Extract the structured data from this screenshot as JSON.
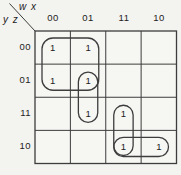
{
  "diagram": {
    "type": "karnaugh_map",
    "corner": {
      "top_label": "w x",
      "side_label": "y z"
    },
    "col_headers": [
      "00",
      "01",
      "11",
      "10"
    ],
    "row_headers": [
      "00",
      "01",
      "11",
      "10"
    ],
    "cells": [
      "1",
      "1",
      "",
      "",
      "1",
      "1",
      "",
      "",
      "",
      "1",
      "1",
      "",
      "",
      "",
      "1",
      "1"
    ],
    "loops": [
      {
        "id": "loop-1",
        "rows": [
          0,
          1
        ],
        "cols": [
          0,
          1
        ]
      },
      {
        "id": "loop-2",
        "rows": [
          1,
          2
        ],
        "cols": [
          1,
          1
        ]
      },
      {
        "id": "loop-3",
        "rows": [
          2,
          3
        ],
        "cols": [
          2,
          2
        ]
      },
      {
        "id": "loop-4",
        "rows": [
          3,
          3
        ],
        "cols": [
          2,
          3
        ]
      }
    ],
    "colors": {
      "background": "#f3f3f0",
      "cell_fill": "#f6f6f3",
      "line": "#3d3d3d",
      "text": "#1c1c1c"
    }
  }
}
